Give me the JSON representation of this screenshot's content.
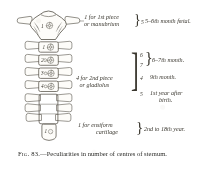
{
  "figure": {
    "caption_label": "Fig. 83.",
    "caption_dash": "—",
    "caption_text": "Peculiarities in number of centres of sternum."
  },
  "bone": {
    "parts": [
      {
        "id": "manubrium",
        "centre_label": "1",
        "centres_drawn": 1
      },
      {
        "id": "gladiolus-seg-1",
        "centre_label": "1",
        "centres_drawn": 1
      },
      {
        "id": "gladiolus-seg-2",
        "centre_label": "2",
        "centres_drawn": 2
      },
      {
        "id": "gladiolus-seg-3",
        "centre_label": "3",
        "centres_drawn": 2
      },
      {
        "id": "gladiolus-seg-4",
        "centre_label": "4",
        "centres_drawn": 2
      },
      {
        "id": "ensiform-cartilage",
        "centre_label": "1",
        "centres_drawn": 1
      }
    ],
    "costal_notch_pairs": 7
  },
  "annotations": {
    "rows": [
      {
        "group_line1": "1 for 1st piece",
        "group_line2": "or manubrium",
        "numbers": [
          "5"
        ],
        "stage": "5–6th month fœtal.",
        "braced": true
      },
      {
        "group_line1": "4 for 2nd piece",
        "group_line2": "or gladiolus",
        "numbers": [
          "6",
          "7"
        ],
        "stage": "6–7th month.",
        "braced": true
      },
      {
        "group_line1": "",
        "group_line2": "",
        "numbers": [
          "4"
        ],
        "stage": "9th month.",
        "braced": false
      },
      {
        "group_line1": "",
        "group_line2": "",
        "numbers": [
          "5"
        ],
        "stage": "1st year after",
        "stage_line2": "birth.",
        "braced": false
      },
      {
        "group_line1": "1 for ensiform",
        "group_line2": "cartilage",
        "numbers": [],
        "stage": "2nd to 18th year.",
        "braced": true
      }
    ]
  },
  "colors": {
    "ink": "#3a372f",
    "caption_ink": "#2b2b28",
    "paper": "#ffffff",
    "bone_outline": "#4a463c",
    "bone_fill": "#fdfcf9",
    "centre_stipple": "#5d5848"
  }
}
